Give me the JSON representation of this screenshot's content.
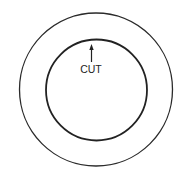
{
  "diagram": {
    "outer_circle": {
      "cx": 96,
      "cy": 89.5,
      "r": 76.5,
      "stroke": "#2a2a2a",
      "stroke_width": 1.3
    },
    "inner_circle": {
      "cx": 96.5,
      "cy": 90,
      "r": 50.5,
      "stroke": "#222222",
      "stroke_width": 1.8
    },
    "arrow": {
      "x": 91.5,
      "y_tip": 44,
      "y_tail": 62
    },
    "label": {
      "text": "CUT",
      "x": 91,
      "y": 73
    }
  }
}
